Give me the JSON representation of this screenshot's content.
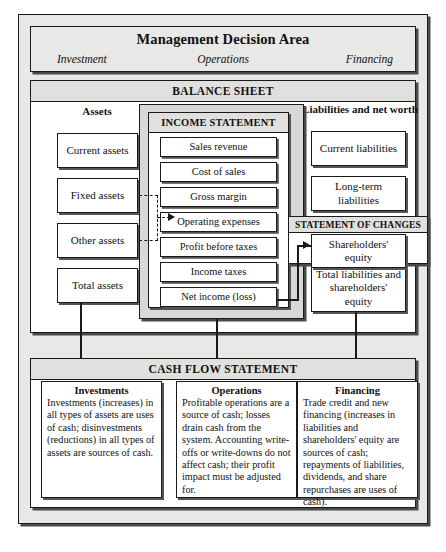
{
  "management": {
    "title": "Management Decision Area",
    "investment": "Investment",
    "operations": "Operations",
    "financing": "Financing"
  },
  "balance_sheet": {
    "header": "BALANCE SHEET",
    "assets_heading": "Assets",
    "liabilities_heading": "Liabilities and net worth",
    "assets": [
      "Current assets",
      "Fixed assets",
      "Other assets",
      "Total assets"
    ],
    "liabilities": [
      "Current liabilities",
      "Long-term liabilities",
      "Total liabilities and shareholders' equity"
    ],
    "shareholders_equity": "Shareholders' equity"
  },
  "income_statement": {
    "header": "INCOME STATEMENT",
    "items": [
      "Sales revenue",
      "Cost of sales",
      "Gross margin",
      "Operating expenses",
      "Profit before taxes",
      "Income taxes",
      "Net income (loss)"
    ]
  },
  "statement_of_changes": {
    "header": "STATEMENT OF CHANGES"
  },
  "cash_flow": {
    "header": "CASH FLOW STATEMENT",
    "columns": [
      {
        "title": "Investments",
        "body": "Investments (increases) in all types of assets are uses of cash; disinvestments (reductions) in all types of assets are sources of cash."
      },
      {
        "title": "Operations",
        "body": "Profitable operations are a source of cash; losses drain cash from the system. Accounting write-offs or write-downs do not affect cash; their profit impact must be adjusted for."
      },
      {
        "title": "Financing",
        "body": "Trade credit and new financing (increases in liabilities and shareholders' equity are sources of cash; repayments of liabilities, dividends, and share repurchases are uses of cash)."
      }
    ]
  },
  "colors": {
    "panel": "#e8e8e6",
    "header_band": "#e0e0de",
    "line": "#1a1a1a",
    "shadow": "#4a4a4a"
  }
}
